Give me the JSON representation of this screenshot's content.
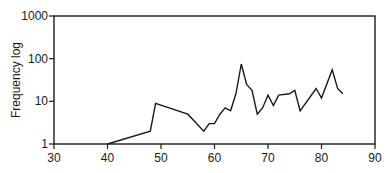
{
  "chart_data": {
    "type": "line",
    "title": "",
    "xlabel": "",
    "ylabel": "Frequency log",
    "yscale": "log",
    "xlim": [
      30,
      90
    ],
    "ylim": [
      1,
      1000
    ],
    "x_ticks": [
      30,
      40,
      50,
      60,
      70,
      80,
      90
    ],
    "y_ticks": [
      1,
      10,
      100,
      1000
    ],
    "y_tick_labels": [
      "1",
      "10",
      "100",
      "1000"
    ],
    "grid": false,
    "legend": null,
    "series": [
      {
        "name": "Frequency",
        "x": [
          40,
          48,
          49,
          55,
          58,
          59,
          60,
          61,
          62,
          63,
          64,
          65,
          66,
          67,
          68,
          69,
          70,
          71,
          72,
          74,
          75,
          76,
          79,
          80,
          82,
          83,
          84
        ],
        "values": [
          1,
          2,
          9,
          5,
          2,
          3,
          3,
          5,
          7,
          6,
          15,
          75,
          25,
          18,
          5,
          7,
          14,
          8,
          14,
          15,
          18,
          6,
          20,
          12,
          55,
          20,
          15
        ]
      }
    ]
  }
}
